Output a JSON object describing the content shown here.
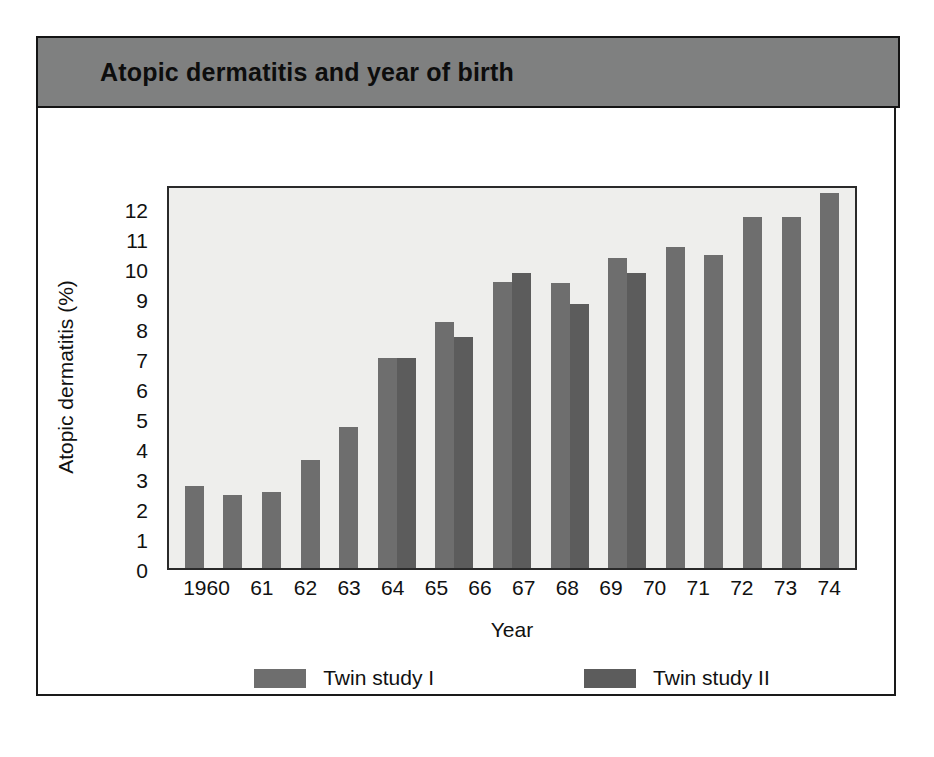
{
  "figure": {
    "title": "Atopic dermatitis and year of birth"
  },
  "legend": {
    "entries": [
      {
        "label": "Twin study I",
        "color": "#6e6e6e"
      },
      {
        "label": "Twin study II",
        "color": "#5c5c5c"
      }
    ]
  },
  "chart_data": {
    "type": "bar",
    "title": "Atopic dermatitis and year of birth",
    "xlabel": "Year",
    "ylabel": "Atopic dermatitis (%)",
    "ylim": [
      0,
      12.8
    ],
    "yticks": [
      0,
      1,
      2,
      3,
      4,
      5,
      6,
      7,
      8,
      9,
      10,
      11,
      12
    ],
    "ytick_labels": [
      "0",
      "1",
      "2",
      "3",
      "4",
      "5",
      "6",
      "7",
      "8",
      "9",
      "10",
      "11",
      "12"
    ],
    "grid": false,
    "legend_position": "bottom",
    "categories": [
      "1960",
      "61",
      "62",
      "63",
      "64",
      "65",
      "66",
      "67",
      "68",
      "69",
      "70",
      "71",
      "72",
      "73",
      "74"
    ],
    "series": [
      {
        "name": "Twin study I",
        "color": "#6e6e6e",
        "values": [
          2.75,
          2.45,
          2.55,
          3.6,
          4.7,
          7.0,
          8.2,
          9.55,
          9.5,
          10.35,
          10.7,
          10.45,
          11.7,
          11.7,
          12.5
        ]
      },
      {
        "name": "Twin study II",
        "color": "#5c5c5c",
        "values": [
          null,
          null,
          null,
          null,
          null,
          7.0,
          7.7,
          9.85,
          8.8,
          9.85,
          null,
          null,
          null,
          null,
          null
        ]
      }
    ]
  }
}
